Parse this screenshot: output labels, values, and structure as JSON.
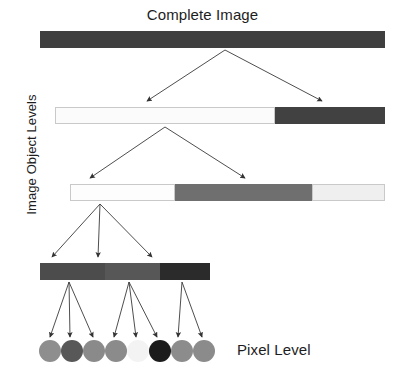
{
  "figure": {
    "title": "Complete Image",
    "pixel_level_label": "Pixel Level",
    "axis_label": "Image Object Levels",
    "background_color": "#ffffff",
    "arrow_color": "#3a3a3a",
    "type": "hierarchical-tree-diagram"
  },
  "levels": [
    {
      "name": "level-1-complete-image",
      "x": 40,
      "y": 31,
      "width": 345,
      "height": 17,
      "segments": [
        {
          "name": "segment-whole",
          "color": "#3f3f3f",
          "width": 345,
          "outlined": false
        }
      ]
    },
    {
      "name": "level-2",
      "x": 55,
      "y": 107,
      "width": 330,
      "height": 17,
      "segments": [
        {
          "name": "segment-light",
          "color": "#fbfbfb",
          "width": 220,
          "outlined": true
        },
        {
          "name": "segment-dark",
          "color": "#414141",
          "width": 110,
          "outlined": false
        }
      ]
    },
    {
      "name": "level-3",
      "x": 70,
      "y": 184,
      "width": 315,
      "height": 17,
      "segments": [
        {
          "name": "segment-white",
          "color": "#fdfdfd",
          "width": 105,
          "outlined": true
        },
        {
          "name": "segment-mid-gray",
          "color": "#6f6f6f",
          "width": 137,
          "outlined": false
        },
        {
          "name": "segment-light-gray",
          "color": "#efefef",
          "width": 73,
          "outlined": true
        }
      ]
    },
    {
      "name": "level-4",
      "x": 40,
      "y": 263,
      "width": 170,
      "height": 17,
      "segments": [
        {
          "name": "segment-dark-gray",
          "color": "#4c4c4c",
          "width": 65,
          "outlined": false
        },
        {
          "name": "segment-medium-gray",
          "color": "#575757",
          "width": 55,
          "outlined": false
        },
        {
          "name": "segment-very-dark",
          "color": "#2b2b2b",
          "width": 50,
          "outlined": false
        }
      ]
    }
  ],
  "pixels": [
    {
      "name": "pixel-1",
      "cx": 50,
      "cy": 351,
      "r": 11,
      "color": "#8e8e8e"
    },
    {
      "name": "pixel-2",
      "cx": 72,
      "cy": 351,
      "r": 11,
      "color": "#585858"
    },
    {
      "name": "pixel-3",
      "cx": 94,
      "cy": 351,
      "r": 11,
      "color": "#8a8a8a"
    },
    {
      "name": "pixel-4",
      "cx": 116,
      "cy": 351,
      "r": 11,
      "color": "#8b8b8b"
    },
    {
      "name": "pixel-5",
      "cx": 138,
      "cy": 351,
      "r": 11,
      "color": "#f3f3f3"
    },
    {
      "name": "pixel-6",
      "cx": 160,
      "cy": 351,
      "r": 11,
      "color": "#1c1c1c"
    },
    {
      "name": "pixel-7",
      "cx": 182,
      "cy": 351,
      "r": 11,
      "color": "#8c8c8c"
    },
    {
      "name": "pixel-8",
      "cx": 204,
      "cy": 351,
      "r": 11,
      "color": "#8b8b8b"
    }
  ],
  "arrows": [
    {
      "name": "arrow-l1-to-l2-left",
      "x1": 225,
      "y1": 50,
      "x2": 147,
      "y2": 101
    },
    {
      "name": "arrow-l1-to-l2-right",
      "x1": 225,
      "y1": 50,
      "x2": 322,
      "y2": 101
    },
    {
      "name": "arrow-l2-to-l3-left",
      "x1": 165,
      "y1": 127,
      "x2": 90,
      "y2": 178
    },
    {
      "name": "arrow-l2-to-l3-right",
      "x1": 165,
      "y1": 127,
      "x2": 245,
      "y2": 178
    },
    {
      "name": "arrow-l3-to-l4-left",
      "x1": 100,
      "y1": 204,
      "x2": 52,
      "y2": 257
    },
    {
      "name": "arrow-l3-to-l4-middle",
      "x1": 100,
      "y1": 204,
      "x2": 98,
      "y2": 257
    },
    {
      "name": "arrow-l3-to-l4-right",
      "x1": 100,
      "y1": 204,
      "x2": 152,
      "y2": 257
    },
    {
      "name": "arrow-l4a-to-pixel-1",
      "x1": 69,
      "y1": 282,
      "x2": 50,
      "y2": 337
    },
    {
      "name": "arrow-l4a-to-pixel-2",
      "x1": 69,
      "y1": 282,
      "x2": 70,
      "y2": 337
    },
    {
      "name": "arrow-l4a-to-pixel-3",
      "x1": 69,
      "y1": 282,
      "x2": 93,
      "y2": 337
    },
    {
      "name": "arrow-l4b-to-pixel-4",
      "x1": 129,
      "y1": 282,
      "x2": 114,
      "y2": 337
    },
    {
      "name": "arrow-l4b-to-pixel-5",
      "x1": 129,
      "y1": 282,
      "x2": 136,
      "y2": 337
    },
    {
      "name": "arrow-l4b-to-pixel-6",
      "x1": 129,
      "y1": 282,
      "x2": 157,
      "y2": 337
    },
    {
      "name": "arrow-l4c-to-pixel-7",
      "x1": 182,
      "y1": 282,
      "x2": 178,
      "y2": 337
    },
    {
      "name": "arrow-l4c-to-pixel-8",
      "x1": 182,
      "y1": 282,
      "x2": 202,
      "y2": 337
    }
  ]
}
